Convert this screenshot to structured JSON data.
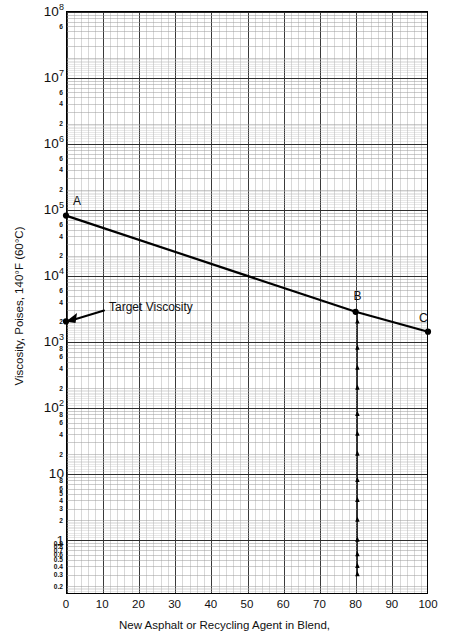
{
  "chart_data": {
    "type": "line",
    "title": "",
    "xlabel": "New Asphalt or Recycling Agent in Blend,",
    "ylabel": "Viscosity, Poises, 140°F (60°C)",
    "xlim": [
      0,
      100
    ],
    "ylim": [
      0.15,
      100000000
    ],
    "yscale": "log",
    "xscale": "linear",
    "grid": true,
    "legend": null,
    "xticks": [
      "0",
      "10",
      "20",
      "30",
      "40",
      "50",
      "60",
      "70",
      "80",
      "90",
      "100"
    ],
    "xtickvalues": [
      0,
      10,
      20,
      30,
      40,
      50,
      60,
      70,
      80,
      90,
      100
    ],
    "ymajorticks": [
      {
        "value": 100000000,
        "mantissa": "10",
        "exp": "8"
      },
      {
        "value": 10000000,
        "mantissa": "10",
        "exp": "7"
      },
      {
        "value": 1000000,
        "mantissa": "10",
        "exp": "6"
      },
      {
        "value": 100000,
        "mantissa": "10",
        "exp": "5"
      },
      {
        "value": 10000,
        "mantissa": "10",
        "exp": "4"
      },
      {
        "value": 1000,
        "mantissa": "10",
        "exp": "3"
      },
      {
        "value": 100,
        "mantissa": "10",
        "exp": "2"
      },
      {
        "value": 10,
        "mantissa": "10",
        "exp": ""
      },
      {
        "value": 1,
        "mantissa": "1",
        "exp": ""
      }
    ],
    "yminorticks": [
      {
        "value": 60000000,
        "label": "6"
      },
      {
        "value": 6000000,
        "label": "6"
      },
      {
        "value": 4000000,
        "label": "4"
      },
      {
        "value": 2000000,
        "label": "2"
      },
      {
        "value": 600000,
        "label": "6"
      },
      {
        "value": 400000,
        "label": "4"
      },
      {
        "value": 200000,
        "label": "2"
      },
      {
        "value": 60000,
        "label": "6"
      },
      {
        "value": 40000,
        "label": "4"
      },
      {
        "value": 20000,
        "label": "2"
      },
      {
        "value": 6000,
        "label": "6"
      },
      {
        "value": 4000,
        "label": "4"
      },
      {
        "value": 2000,
        "label": "2"
      },
      {
        "value": 800,
        "label": "8"
      },
      {
        "value": 600,
        "label": "6"
      },
      {
        "value": 400,
        "label": "4"
      },
      {
        "value": 200,
        "label": "2"
      },
      {
        "value": 80,
        "label": "8"
      },
      {
        "value": 60,
        "label": "6"
      },
      {
        "value": 40,
        "label": "4"
      },
      {
        "value": 20,
        "label": "2"
      },
      {
        "value": 8,
        "label": "8"
      },
      {
        "value": 6,
        "label": "6"
      },
      {
        "value": 5,
        "label": "5"
      },
      {
        "value": 4,
        "label": "4"
      },
      {
        "value": 3,
        "label": "3"
      },
      {
        "value": 2,
        "label": "2"
      },
      {
        "value": 0.9,
        "label": "0.9"
      },
      {
        "value": 0.8,
        "label": "0.8"
      },
      {
        "value": 0.7,
        "label": "0.7"
      },
      {
        "value": 0.6,
        "label": "0.6"
      },
      {
        "value": 0.5,
        "label": "0.5"
      },
      {
        "value": 0.4,
        "label": "0.4"
      },
      {
        "value": 0.3,
        "label": "0.3"
      },
      {
        "value": 0.2,
        "label": "0.2"
      }
    ],
    "series": [
      {
        "name": "blend-viscosity-line",
        "points": [
          {
            "x": 0,
            "y": 80000,
            "label": "A"
          },
          {
            "x": 80,
            "y": 2800,
            "label": "B"
          },
          {
            "x": 100,
            "y": 1400,
            "label": "C"
          }
        ]
      }
    ],
    "markers": [
      {
        "name": "A",
        "x": 0,
        "y": 80000
      },
      {
        "name": "B",
        "x": 80,
        "y": 2800
      },
      {
        "name": "C",
        "x": 100,
        "y": 1400
      }
    ],
    "annotations": [
      {
        "name": "target-viscosity",
        "text": "Target Viscosity",
        "x": 0,
        "y": 2000
      }
    ],
    "construction_line": {
      "name": "vertical-drop-at-80",
      "x": 80.5,
      "y_top": 2800,
      "y_bottom": 0.3
    }
  },
  "labels": {
    "point_a": "A",
    "point_b": "B",
    "point_c": "C",
    "target_viscosity": "Target Viscosity"
  },
  "colors": {
    "line": "#000000",
    "grid_major": "#3a3a3a",
    "grid_minor": "#8c8c8c",
    "frame": "#000000",
    "background": "#ffffff"
  }
}
